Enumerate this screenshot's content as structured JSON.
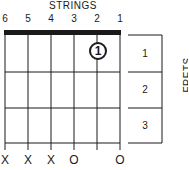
{
  "diagram": {
    "title": "STRINGS",
    "string_numbers": [
      "6",
      "5",
      "4",
      "3",
      "2",
      "1"
    ],
    "fret_label": "FRETS",
    "fret_numbers": [
      "1",
      "2",
      "3"
    ],
    "string_markers": [
      "X",
      "X",
      "X",
      "O",
      "",
      "O"
    ],
    "fingerings": [
      {
        "string": 2,
        "fret": 1,
        "finger": "1"
      }
    ],
    "colors": {
      "ink": "#1a1a1a",
      "background": "#ffffff"
    }
  }
}
